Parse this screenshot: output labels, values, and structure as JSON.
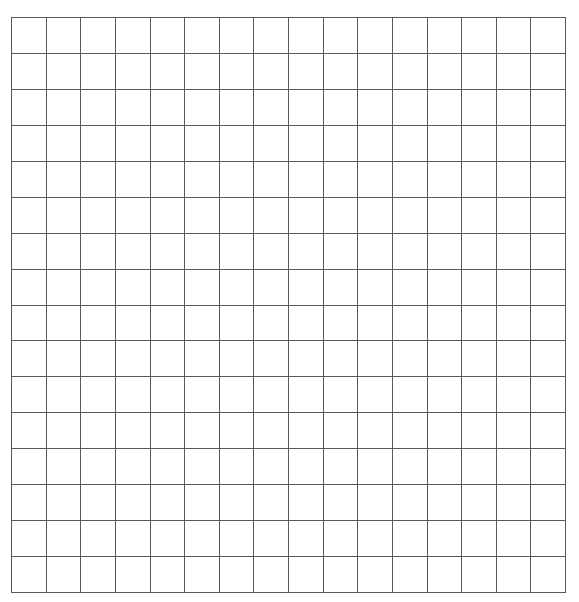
{
  "page": {
    "background": "#ffffff",
    "line_color": "#5a5a5a",
    "top_cropped_text": ""
  },
  "grid": {
    "rows": 16,
    "columns": 16,
    "cells_filled": false
  }
}
